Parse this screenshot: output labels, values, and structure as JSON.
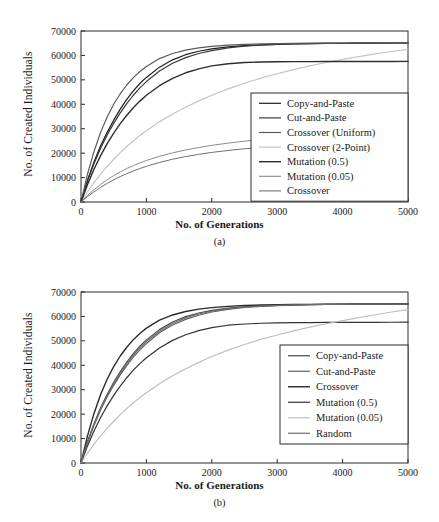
{
  "figure": {
    "panels": [
      {
        "id": "a",
        "caption": "(a)",
        "xlabel": "No. of Generations",
        "ylabel": "No. of Created Individuals"
      },
      {
        "id": "b",
        "caption": "(b)",
        "xlabel": "No. of Generations",
        "ylabel": "No. of Created Individuals"
      }
    ]
  },
  "chart_data": [
    {
      "type": "line",
      "panel": "a",
      "title": "",
      "xlabel": "No. of Generations",
      "ylabel": "No. of Created Individuals",
      "xlim": [
        0,
        5000
      ],
      "ylim": [
        0,
        70000
      ],
      "xticks": [
        0,
        1000,
        2000,
        3000,
        4000,
        5000
      ],
      "yticks": [
        0,
        10000,
        20000,
        30000,
        40000,
        50000,
        60000,
        70000
      ],
      "xtick_labels": [
        "0",
        "1000",
        "2000",
        "3000",
        "4000",
        "5000"
      ],
      "ytick_labels": [
        "0",
        "10000",
        "20000",
        "30000",
        "40000",
        "50000",
        "60000",
        "70000"
      ],
      "grid": false,
      "legend_position": "lower-right-inside",
      "x": [
        0,
        100,
        200,
        300,
        400,
        500,
        600,
        700,
        800,
        900,
        1000,
        1200,
        1400,
        1600,
        1800,
        2000,
        2250,
        2500,
        2750,
        3000,
        3250,
        3500,
        3750,
        4000,
        4250,
        4500,
        4750,
        5000
      ],
      "series": [
        {
          "name": "Copy-and-Paste",
          "color": "#1c1c1c",
          "width": 1.2,
          "values": [
            0,
            9000,
            16500,
            23000,
            28500,
            33500,
            38000,
            42000,
            45500,
            48500,
            51000,
            55200,
            58200,
            60300,
            61700,
            62700,
            63500,
            64000,
            64300,
            64550,
            64700,
            64800,
            64900,
            64950,
            65000,
            65050,
            65080,
            65100
          ]
        },
        {
          "name": "Cut-and-Paste",
          "color": "#3a3a3a",
          "width": 1.2,
          "values": [
            0,
            8600,
            15800,
            22000,
            27400,
            32200,
            36500,
            40300,
            43700,
            46700,
            49300,
            53600,
            56800,
            59100,
            60800,
            62000,
            63100,
            63800,
            64200,
            64500,
            64700,
            64800,
            64900,
            64950,
            65000,
            65030,
            65060,
            65080
          ]
        },
        {
          "name": "Crossover (Uniform)",
          "color": "#5a5a5a",
          "width": 1.2,
          "values": [
            0,
            11500,
            20800,
            28500,
            34800,
            40000,
            44300,
            47900,
            50900,
            53400,
            55500,
            58700,
            60800,
            62200,
            63100,
            63700,
            64200,
            64500,
            64700,
            64850,
            64950,
            65000,
            65050,
            65080,
            65100,
            65120,
            65140,
            65150
          ]
        },
        {
          "name": "Crossover (2-Point)",
          "color": "#c4c4c4",
          "width": 1.2,
          "values": [
            0,
            4200,
            8000,
            11400,
            14600,
            17500,
            20200,
            22700,
            25000,
            27200,
            29200,
            32800,
            36000,
            38800,
            41400,
            43700,
            46300,
            48600,
            50700,
            52500,
            54200,
            55700,
            57100,
            58400,
            59500,
            60600,
            61600,
            62500
          ]
        },
        {
          "name": "Mutation (0.5)",
          "color": "#2e2e2e",
          "width": 1.4,
          "values": [
            0,
            7200,
            13500,
            19000,
            23900,
            28200,
            32100,
            35500,
            38600,
            41300,
            43700,
            47600,
            50600,
            52900,
            54500,
            55700,
            56600,
            57100,
            57300,
            57400,
            57450,
            57480,
            57500,
            57510,
            57520,
            57530,
            57540,
            57550
          ]
        },
        {
          "name": "Mutation (0.05)",
          "color": "#8a8a8a",
          "width": 1.0,
          "values": [
            0,
            2700,
            5100,
            7200,
            9100,
            10800,
            12300,
            13700,
            14900,
            16000,
            17000,
            18700,
            20100,
            21300,
            22300,
            23200,
            24100,
            24900,
            25500,
            26000,
            26400,
            26700,
            27000,
            27200,
            27400,
            27550,
            27700,
            27800
          ]
        },
        {
          "name": "Crossover",
          "color": "#707070",
          "width": 1.0,
          "values": [
            0,
            2200,
            4200,
            6000,
            7600,
            9100,
            10400,
            11600,
            12700,
            13700,
            14600,
            16200,
            17500,
            18600,
            19500,
            20300,
            21100,
            21800,
            22300,
            22700,
            23000,
            23250,
            23450,
            23600,
            23700,
            23800,
            23900,
            23950
          ]
        }
      ]
    },
    {
      "type": "line",
      "panel": "b",
      "title": "",
      "xlabel": "No. of Generations",
      "ylabel": "No. of Created Individuals",
      "xlim": [
        0,
        5000
      ],
      "ylim": [
        0,
        70000
      ],
      "xticks": [
        0,
        1000,
        2000,
        3000,
        4000,
        5000
      ],
      "yticks": [
        0,
        10000,
        20000,
        30000,
        40000,
        50000,
        60000,
        70000
      ],
      "xtick_labels": [
        "0",
        "1000",
        "2000",
        "3000",
        "4000",
        "5000"
      ],
      "ytick_labels": [
        "0",
        "10000",
        "20000",
        "30000",
        "40000",
        "50000",
        "60000",
        "70000"
      ],
      "grid": false,
      "legend_position": "lower-right-inside",
      "x": [
        0,
        100,
        200,
        300,
        400,
        500,
        600,
        700,
        800,
        900,
        1000,
        1200,
        1400,
        1600,
        1800,
        2000,
        2250,
        2500,
        2750,
        3000,
        3250,
        3500,
        3750,
        4000,
        4250,
        4500,
        4750,
        5000
      ],
      "series": [
        {
          "name": "Copy-and-Paste",
          "color": "#4a4a4a",
          "width": 1.2,
          "values": [
            0,
            8800,
            16200,
            22600,
            28100,
            33000,
            37400,
            41300,
            44800,
            47800,
            50400,
            54600,
            57700,
            59900,
            61400,
            62500,
            63400,
            63900,
            64300,
            64550,
            64700,
            64800,
            64900,
            64950,
            65000,
            65050,
            65080,
            65100
          ]
        },
        {
          "name": "Cut-and-Paste",
          "color": "#5f5f5f",
          "width": 1.2,
          "values": [
            0,
            8400,
            15500,
            21700,
            27000,
            31800,
            36100,
            39900,
            43300,
            46300,
            48900,
            53300,
            56500,
            58800,
            60500,
            61800,
            62900,
            63700,
            64100,
            64450,
            64650,
            64780,
            64880,
            64940,
            64990,
            65020,
            65050,
            65070
          ]
        },
        {
          "name": "Crossover",
          "color": "#2a2a2a",
          "width": 1.4,
          "values": [
            0,
            11200,
            20400,
            28000,
            34300,
            39500,
            43800,
            47400,
            50500,
            53000,
            55200,
            58500,
            60600,
            62000,
            63000,
            63600,
            64100,
            64450,
            64650,
            64800,
            64900,
            64950,
            65000,
            65030,
            65060,
            65080,
            65100,
            65120
          ]
        },
        {
          "name": "Mutation (0.5)",
          "color": "#333333",
          "width": 1.2,
          "values": [
            0,
            7000,
            13200,
            18600,
            23400,
            27700,
            31500,
            34900,
            38000,
            40700,
            43100,
            47100,
            50200,
            52500,
            54200,
            55400,
            56400,
            56900,
            57200,
            57350,
            57450,
            57500,
            57530,
            57560,
            57580,
            57600,
            57620,
            57640
          ]
        },
        {
          "name": "Mutation (0.05)",
          "color": "#bfbfbf",
          "width": 1.2,
          "values": [
            0,
            4000,
            7700,
            11100,
            14200,
            17100,
            19800,
            22300,
            24600,
            26800,
            28800,
            32400,
            35700,
            38600,
            41200,
            43600,
            46200,
            48500,
            50600,
            52400,
            54100,
            55600,
            57000,
            58300,
            59500,
            60700,
            61800,
            62800
          ]
        },
        {
          "name": "Random",
          "color": "#6e6e6e",
          "width": 1.2,
          "values": [
            0,
            8600,
            15900,
            22200,
            27600,
            32500,
            36800,
            40700,
            44100,
            47100,
            49700,
            53900,
            57100,
            59400,
            61000,
            62200,
            63200,
            63850,
            64250,
            64520,
            64700,
            64820,
            64900,
            64960,
            65000,
            65040,
            65070,
            65090
          ]
        }
      ]
    }
  ]
}
